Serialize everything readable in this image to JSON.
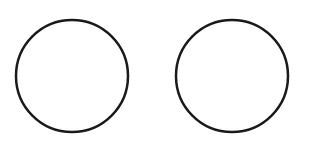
{
  "diagram": {
    "background": "#ffffff",
    "stroke_color": "#1a1a1a",
    "stroke_width": 2.5,
    "shapes": [
      {
        "type": "circle",
        "cx": 72,
        "cy": 76,
        "r": 56
      },
      {
        "type": "circle",
        "cx": 232,
        "cy": 76,
        "r": 56
      }
    ]
  }
}
